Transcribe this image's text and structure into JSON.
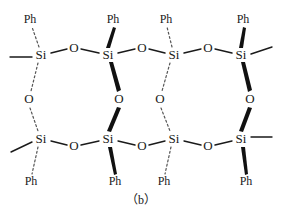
{
  "figure": {
    "caption": "（b）",
    "colors": {
      "ink": "#1a1a1a",
      "dashed": "#555555",
      "wedge": "#111111",
      "background": "#ffffff"
    }
  },
  "labels": {
    "silicon": "Si",
    "oxygen": "O",
    "phenyl": "Ph"
  },
  "atoms": {
    "silicon_top": [
      {
        "id": "si-top-1",
        "label": "Si",
        "x": 41,
        "y": 55
      },
      {
        "id": "si-top-2",
        "label": "Si",
        "x": 108,
        "y": 55
      },
      {
        "id": "si-top-3",
        "label": "Si",
        "x": 174,
        "y": 55
      },
      {
        "id": "si-top-4",
        "label": "Si",
        "x": 241,
        "y": 55
      }
    ],
    "silicon_bottom": [
      {
        "id": "si-bottom-1",
        "label": "Si",
        "x": 41,
        "y": 139
      },
      {
        "id": "si-bottom-2",
        "label": "Si",
        "x": 108,
        "y": 139
      },
      {
        "id": "si-bottom-3",
        "label": "Si",
        "x": 174,
        "y": 139
      },
      {
        "id": "si-bottom-4",
        "label": "Si",
        "x": 241,
        "y": 139
      }
    ],
    "oxygen_top": [
      {
        "id": "o-top-1",
        "label": "O",
        "x": 74,
        "y": 48
      },
      {
        "id": "o-top-2",
        "label": "O",
        "x": 142,
        "y": 48
      },
      {
        "id": "o-top-3",
        "label": "O",
        "x": 208,
        "y": 48
      }
    ],
    "oxygen_bottom": [
      {
        "id": "o-bottom-1",
        "label": "O",
        "x": 74,
        "y": 146
      },
      {
        "id": "o-bottom-2",
        "label": "O",
        "x": 142,
        "y": 146
      },
      {
        "id": "o-bottom-3",
        "label": "O",
        "x": 208,
        "y": 146
      }
    ],
    "oxygen_bridge": [
      {
        "id": "o-bridge-1",
        "label": "O",
        "x": 29,
        "y": 99,
        "bond_style": "dashed"
      },
      {
        "id": "o-bridge-2",
        "label": "O",
        "x": 119,
        "y": 99,
        "bond_style": "wedge"
      },
      {
        "id": "o-bridge-3",
        "label": "O",
        "x": 160,
        "y": 99,
        "bond_style": "dashed"
      },
      {
        "id": "o-bridge-4",
        "label": "O",
        "x": 250,
        "y": 99,
        "bond_style": "wedge"
      }
    ]
  },
  "substituents": {
    "phenyl_top": [
      {
        "id": "ph-top-1",
        "label": "Ph",
        "x": 30,
        "y": 20,
        "bond_style": "dashed"
      },
      {
        "id": "ph-top-2",
        "label": "Ph",
        "x": 113,
        "y": 20,
        "bond_style": "wedge"
      },
      {
        "id": "ph-top-3",
        "label": "Ph",
        "x": 166,
        "y": 20,
        "bond_style": "dashed"
      },
      {
        "id": "ph-top-4",
        "label": "Ph",
        "x": 243,
        "y": 20,
        "bond_style": "wedge"
      }
    ],
    "phenyl_bottom": [
      {
        "id": "ph-bottom-1",
        "label": "Ph",
        "x": 31,
        "y": 182,
        "bond_style": "dashed"
      },
      {
        "id": "ph-bottom-2",
        "label": "Ph",
        "x": 115,
        "y": 182,
        "bond_style": "wedge"
      },
      {
        "id": "ph-bottom-3",
        "label": "Ph",
        "x": 164,
        "y": 182,
        "bond_style": "dashed"
      },
      {
        "id": "ph-bottom-4",
        "label": "Ph",
        "x": 246,
        "y": 182,
        "bond_style": "wedge"
      }
    ]
  },
  "terminal_bonds": [
    {
      "id": "term-top-left",
      "from": [
        33,
        57
      ],
      "to": [
        10,
        57
      ]
    },
    {
      "id": "term-top-right",
      "from": [
        250,
        57
      ],
      "to": [
        272,
        48
      ]
    },
    {
      "id": "term-bottom-left",
      "from": [
        33,
        143
      ],
      "to": [
        12,
        152
      ]
    },
    {
      "id": "term-bottom-right",
      "from": [
        250,
        137
      ],
      "to": [
        272,
        137
      ]
    }
  ]
}
